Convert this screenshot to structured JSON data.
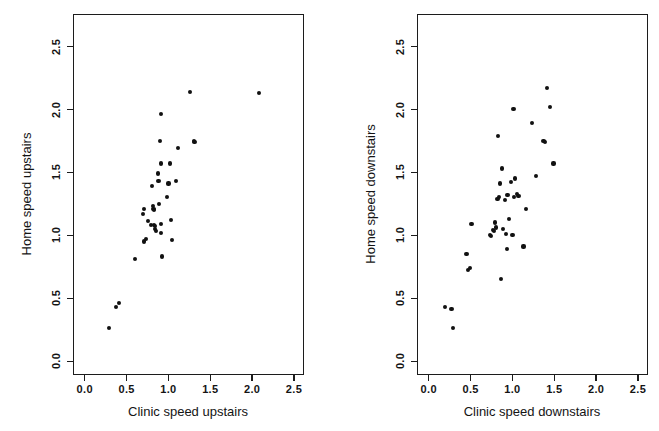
{
  "figure": {
    "width": 659,
    "height": 431,
    "background": "#ffffff",
    "point_color": "#111111",
    "axis_color": "#1c1c1c"
  },
  "chart_data": [
    {
      "type": "scatter",
      "panel": "left",
      "title": "",
      "xlabel": "Clinic speed upstairs",
      "ylabel": "Home speed upstairs",
      "xlim": [
        -0.14,
        2.62
      ],
      "ylim": [
        -0.11,
        2.76
      ],
      "xticks": [
        0.0,
        0.5,
        1.0,
        1.5,
        2.0,
        2.5
      ],
      "yticks": [
        0.0,
        0.5,
        1.0,
        1.5,
        2.0,
        2.5
      ],
      "xticklabels": [
        "0.0",
        "0.5",
        "1.0",
        "1.5",
        "2.0",
        "2.5"
      ],
      "yticklabels": [
        "0.0",
        "0.5",
        "1.0",
        "1.5",
        "2.0",
        "2.5"
      ],
      "grid": false,
      "legend": null,
      "n_points": 38,
      "points": [
        [
          0.28,
          0.27
        ],
        [
          0.36,
          0.44
        ],
        [
          0.4,
          0.47
        ],
        [
          0.59,
          0.82
        ],
        [
          0.68,
          1.18
        ],
        [
          0.7,
          1.22
        ],
        [
          0.7,
          0.96
        ],
        [
          0.72,
          0.98
        ],
        [
          0.74,
          1.12
        ],
        [
          0.78,
          1.09
        ],
        [
          0.79,
          1.4
        ],
        [
          0.8,
          1.24
        ],
        [
          0.81,
          1.22
        ],
        [
          0.82,
          1.21
        ],
        [
          0.82,
          1.09
        ],
        [
          0.83,
          1.08
        ],
        [
          0.83,
          1.06
        ],
        [
          0.84,
          1.04
        ],
        [
          0.86,
          1.5
        ],
        [
          0.87,
          1.44
        ],
        [
          0.88,
          1.26
        ],
        [
          0.89,
          1.76
        ],
        [
          0.9,
          1.58
        ],
        [
          0.9,
          1.97
        ],
        [
          0.9,
          1.1
        ],
        [
          0.9,
          1.03
        ],
        [
          0.91,
          0.84
        ],
        [
          0.97,
          1.31
        ],
        [
          0.99,
          1.42
        ],
        [
          1.01,
          1.58
        ],
        [
          1.02,
          1.13
        ],
        [
          1.03,
          0.97
        ],
        [
          1.08,
          1.44
        ],
        [
          1.1,
          1.7
        ],
        [
          1.25,
          2.15
        ],
        [
          1.29,
          1.76
        ],
        [
          1.3,
          1.75
        ],
        [
          2.07,
          2.14
        ]
      ]
    },
    {
      "type": "scatter",
      "panel": "right",
      "title": "",
      "xlabel": "Clinic speed downstairs",
      "ylabel": "Home speed downstairs",
      "xlim": [
        -0.14,
        2.62
      ],
      "ylim": [
        -0.11,
        2.76
      ],
      "xticks": [
        0.0,
        0.5,
        1.0,
        1.5,
        2.0,
        2.5
      ],
      "yticks": [
        0.0,
        0.5,
        1.0,
        1.5,
        2.0,
        2.5
      ],
      "xticklabels": [
        "0.0",
        "0.5",
        "1.0",
        "1.5",
        "2.0",
        "2.5"
      ],
      "yticklabels": [
        "0.0",
        "0.5",
        "1.0",
        "1.5",
        "2.0",
        "2.5"
      ],
      "grid": false,
      "legend": null,
      "n_points": 40,
      "points": [
        [
          0.18,
          0.44
        ],
        [
          0.26,
          0.42
        ],
        [
          0.28,
          0.27
        ],
        [
          0.44,
          0.86
        ],
        [
          0.46,
          0.73
        ],
        [
          0.48,
          0.75
        ],
        [
          0.5,
          1.1
        ],
        [
          0.72,
          1.01
        ],
        [
          0.73,
          1.0
        ],
        [
          0.76,
          1.05
        ],
        [
          0.77,
          1.04
        ],
        [
          0.78,
          1.11
        ],
        [
          0.79,
          1.07
        ],
        [
          0.81,
          1.3
        ],
        [
          0.82,
          1.8
        ],
        [
          0.83,
          1.31
        ],
        [
          0.84,
          1.42
        ],
        [
          0.85,
          0.66
        ],
        [
          0.86,
          1.54
        ],
        [
          0.88,
          1.06
        ],
        [
          0.9,
          1.29
        ],
        [
          0.91,
          1.02
        ],
        [
          0.92,
          0.9
        ],
        [
          0.93,
          1.33
        ],
        [
          0.95,
          1.14
        ],
        [
          0.97,
          1.43
        ],
        [
          0.99,
          1.01
        ],
        [
          1.0,
          2.01
        ],
        [
          1.01,
          1.31
        ],
        [
          1.02,
          1.46
        ],
        [
          1.04,
          1.34
        ],
        [
          1.06,
          1.32
        ],
        [
          1.12,
          0.92
        ],
        [
          1.15,
          1.22
        ],
        [
          1.22,
          1.9
        ],
        [
          1.27,
          1.48
        ],
        [
          1.36,
          1.76
        ],
        [
          1.38,
          1.75
        ],
        [
          1.4,
          2.18
        ],
        [
          1.44,
          2.03
        ],
        [
          1.48,
          1.58
        ]
      ]
    }
  ]
}
